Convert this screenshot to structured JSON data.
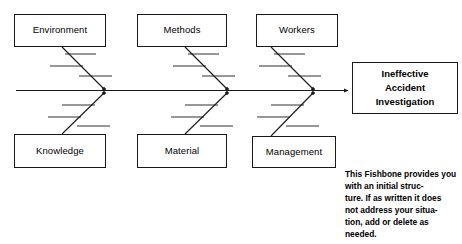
{
  "diagram": {
    "type": "fishbone-cause-and-effect",
    "effect": {
      "line1": "Ineffective",
      "line2": "Accident",
      "line3": "Investigation"
    },
    "categories_top": [
      {
        "label": "Environment"
      },
      {
        "label": "Methods"
      },
      {
        "label": "Workers"
      }
    ],
    "categories_bottom": [
      {
        "label": "Knowledge"
      },
      {
        "label": "Material"
      },
      {
        "label": "Management"
      }
    ],
    "note": "This Fishbone provides you with an initial struc-\nture. If as written it does\nnot address your situa-\ntion, add or delete as\nneeded.",
    "colors": {
      "line": "#1a1a1a",
      "box_border": "#1a1a1a",
      "background": "#ffffff",
      "text": "#000000"
    }
  }
}
